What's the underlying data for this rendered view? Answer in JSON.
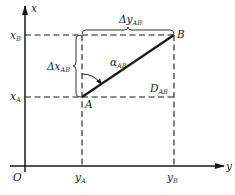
{
  "diagram": {
    "type": "coordinate-azimuth-diagram",
    "colors": {
      "line": "#1a1a1a",
      "background": "#ffffff"
    },
    "axes": {
      "vertical_label": "x",
      "horizontal_label": "y",
      "origin_label": "O"
    },
    "points": {
      "A": {
        "label": "A"
      },
      "B": {
        "label": "B"
      }
    },
    "ticks": {
      "xA": {
        "main": "x",
        "sub": "A"
      },
      "xB": {
        "main": "x",
        "sub": "B"
      },
      "yA": {
        "main": "y",
        "sub": "A"
      },
      "yB": {
        "main": "y",
        "sub": "B"
      }
    },
    "annotations": {
      "delta_x": {
        "prefix": "Δx",
        "sub": "AB"
      },
      "delta_y": {
        "prefix": "Δy",
        "sub": "AB"
      },
      "azimuth": {
        "main": "α",
        "sub": "AB"
      },
      "distance": {
        "main": "D",
        "sub": "AB"
      }
    }
  }
}
